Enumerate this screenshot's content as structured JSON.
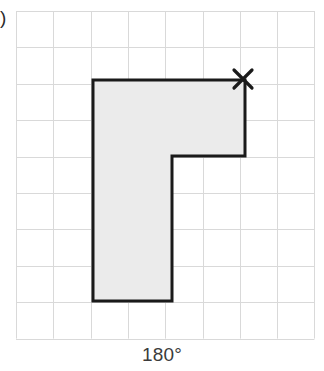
{
  "figure": {
    "caption": "180°",
    "edge_label_fragment": ")",
    "background_color": "#ffffff"
  },
  "grid": {
    "x_left": 16,
    "y_top": 11,
    "columns": 8,
    "rows": 9,
    "cell_width": 37.3,
    "cell_height": 36.4,
    "line_color": "#d9d9d9",
    "line_width": 1
  },
  "shape": {
    "name": "L-shaped polygon",
    "fill_color": "#ebebeb",
    "stroke_color": "#1a1a1a",
    "stroke_width": 3,
    "vertices": [
      [
        93,
        80
      ],
      [
        245,
        80
      ],
      [
        245,
        156
      ],
      [
        172,
        156
      ],
      [
        172,
        301
      ],
      [
        93,
        301
      ]
    ],
    "vertices_in_cells": [
      [
        2,
        2
      ],
      [
        6,
        2
      ],
      [
        6,
        4
      ],
      [
        4,
        4
      ],
      [
        4,
        8
      ],
      [
        2,
        8
      ]
    ]
  },
  "marker": {
    "symbol": "x",
    "label": "center-of-rotation-marker",
    "x": 243,
    "y": 79,
    "arm_length": 9,
    "stroke_color": "#1a1a1a",
    "stroke_width": 3.2
  },
  "chart_data": {
    "type": "table",
    "title": "180°",
    "xlabel": "",
    "ylabel": "",
    "grid": true,
    "categories": [
      "grid_columns",
      "grid_rows"
    ],
    "values": [
      8,
      9
    ]
  }
}
